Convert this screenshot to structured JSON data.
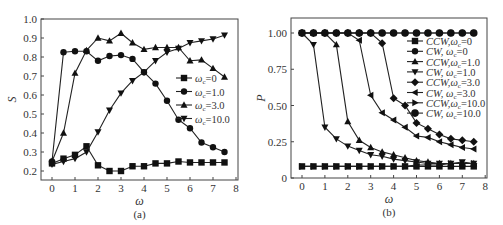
{
  "chart_data": [
    {
      "type": "line",
      "panel": "(a)",
      "xlabel": "ω",
      "ylabel": "S",
      "xlim": [
        -0.5,
        8
      ],
      "ylim": [
        0.15,
        1.0
      ],
      "xticks": [
        0,
        1,
        2,
        3,
        4,
        5,
        6,
        7,
        8
      ],
      "xtick_labels": [
        "0",
        "1",
        "2",
        "3",
        "4",
        "5",
        "6",
        "7",
        "8"
      ],
      "yticks": [
        0.2,
        0.3,
        0.4,
        0.5,
        0.6,
        0.7,
        0.8,
        0.9,
        1.0
      ],
      "ytick_labels": [
        "0.2",
        "0.3",
        "0.4",
        "0.5",
        "0.6",
        "0.7",
        "0.8",
        "0.9",
        "1.0"
      ],
      "legend_position": "center-right",
      "grid": false,
      "x": [
        0,
        0.5,
        1,
        1.5,
        2,
        2.5,
        3,
        3.5,
        4,
        4.5,
        5,
        5.5,
        6,
        6.5,
        7,
        7.5
      ],
      "series": [
        {
          "name": "ωc=0",
          "label_main": "ω",
          "label_sub": "c",
          "label_rest": "=0",
          "marker": "square",
          "values": [
            0.24,
            0.265,
            0.285,
            0.33,
            0.23,
            0.2,
            0.2,
            0.225,
            0.225,
            0.24,
            0.24,
            0.25,
            0.245,
            0.245,
            0.245,
            0.245
          ]
        },
        {
          "name": "ωc=1.0",
          "label_main": "ω",
          "label_sub": "c",
          "label_rest": "=1.0",
          "marker": "circle",
          "values": [
            0.25,
            0.825,
            0.83,
            0.83,
            0.78,
            0.805,
            0.81,
            0.79,
            0.72,
            0.66,
            0.57,
            0.47,
            0.425,
            0.35,
            0.325,
            0.3
          ]
        },
        {
          "name": "ωc=3.0",
          "label_main": "ω",
          "label_sub": "c",
          "label_rest": "=3.0",
          "marker": "triangle-up",
          "values": [
            0.25,
            0.4,
            0.715,
            0.835,
            0.9,
            0.885,
            0.925,
            0.875,
            0.84,
            0.85,
            0.85,
            0.85,
            0.78,
            0.785,
            0.74,
            0.695
          ]
        },
        {
          "name": "ωc=10.0",
          "label_main": "ω",
          "label_sub": "c",
          "label_rest": "=10.0",
          "marker": "triangle-down",
          "values": [
            0.235,
            0.25,
            0.265,
            0.3,
            0.405,
            0.52,
            0.61,
            0.675,
            0.72,
            0.78,
            0.825,
            0.845,
            0.875,
            0.885,
            0.895,
            0.915
          ]
        }
      ]
    },
    {
      "type": "line",
      "panel": "(b)",
      "xlabel": "ω",
      "ylabel": "P",
      "xlim": [
        -0.5,
        8
      ],
      "ylim": [
        0,
        1.1
      ],
      "xticks": [
        0,
        1,
        2,
        3,
        4,
        5,
        6,
        7,
        8
      ],
      "xtick_labels": [
        "0",
        "1",
        "2",
        "3",
        "4",
        "5",
        "6",
        "7",
        "8"
      ],
      "yticks": [
        0,
        0.25,
        0.5,
        0.75,
        1.0
      ],
      "ytick_labels": [
        "0",
        "0.25",
        "0.50",
        "0.75",
        "1.00"
      ],
      "legend_position": "upper-right",
      "grid": false,
      "x": [
        0,
        0.5,
        1,
        1.5,
        2,
        2.5,
        3,
        3.5,
        4,
        4.5,
        5,
        5.5,
        6,
        6.5,
        7,
        7.5
      ],
      "series": [
        {
          "name": "CCW,ωc=0",
          "label_main": "CCW,ω",
          "label_sub": "c",
          "label_rest": "=0",
          "marker": "square",
          "values": [
            0.08,
            0.08,
            0.08,
            0.08,
            0.08,
            0.08,
            0.08,
            0.08,
            0.08,
            0.08,
            0.08,
            0.08,
            0.08,
            0.08,
            0.08,
            0.08
          ]
        },
        {
          "name": "CW, ωc=0",
          "label_main": "CW,  ω",
          "label_sub": "c",
          "label_rest": "=0",
          "marker": "circle",
          "values": [
            1.0,
            1.0,
            1.0,
            1.0,
            1.0,
            1.0,
            1.0,
            1.0,
            1.0,
            1.0,
            1.0,
            1.0,
            1.0,
            1.0,
            1.0,
            1.0
          ]
        },
        {
          "name": "CCW,ωc=1.0",
          "label_main": "CCW,ω",
          "label_sub": "c",
          "label_rest": "=1.0",
          "marker": "triangle-up",
          "values": [
            1.0,
            1.0,
            1.0,
            0.92,
            0.39,
            0.26,
            0.21,
            0.18,
            0.16,
            0.14,
            0.12,
            0.11,
            0.1,
            0.1,
            0.1,
            0.1
          ]
        },
        {
          "name": "CW, ωc=1.0",
          "label_main": "CW,  ω",
          "label_sub": "c",
          "label_rest": "=1.0",
          "marker": "triangle-down",
          "values": [
            1.0,
            0.92,
            0.35,
            0.27,
            0.22,
            0.19,
            0.16,
            0.15,
            0.13,
            0.12,
            0.11,
            0.1,
            0.1,
            0.1,
            0.11,
            0.1
          ]
        },
        {
          "name": "CCW,ωc=3.0",
          "label_main": "CCW,ω",
          "label_sub": "c",
          "label_rest": "=3.0",
          "marker": "diamond",
          "values": [
            1.0,
            1.0,
            1.0,
            1.0,
            1.0,
            1.0,
            1.0,
            0.93,
            0.55,
            0.5,
            0.38,
            0.34,
            0.3,
            0.27,
            0.26,
            0.25
          ]
        },
        {
          "name": "CW, ωc=3.0",
          "label_main": "CW,  ω",
          "label_sub": "c",
          "label_rest": "=3.0",
          "marker": "triangle-left",
          "values": [
            1.0,
            1.0,
            1.0,
            1.0,
            1.0,
            0.95,
            0.57,
            0.45,
            0.4,
            0.35,
            0.29,
            0.28,
            0.25,
            0.23,
            0.21,
            0.2
          ]
        },
        {
          "name": "CCW,ωc=10.0",
          "label_main": "CCW,ω",
          "label_sub": "c",
          "label_rest": "=10.0",
          "marker": "triangle-right",
          "values": [
            0.08,
            0.08,
            0.08,
            0.08,
            0.08,
            0.08,
            0.08,
            0.08,
            0.08,
            0.08,
            0.09,
            0.09,
            0.09,
            0.1,
            0.1,
            0.1
          ]
        },
        {
          "name": "CW, ωc=10.0",
          "label_main": "CW,  ω",
          "label_sub": "c",
          "label_rest": "=10.0",
          "marker": "big-circle",
          "values": [
            1.0,
            1.0,
            1.0,
            1.0,
            1.0,
            1.0,
            1.0,
            1.0,
            1.0,
            1.0,
            1.0,
            1.0,
            1.0,
            1.0,
            1.0,
            1.0
          ]
        }
      ]
    }
  ]
}
